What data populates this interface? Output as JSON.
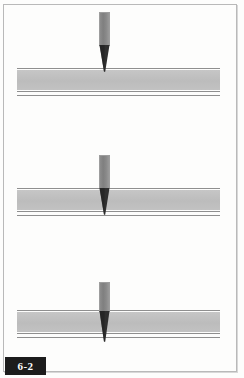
{
  "figure": {
    "number_label": "6-2",
    "caption": "",
    "page_background": "#fdfdfc",
    "frame_color": "#b9b9b9"
  },
  "colors": {
    "workpiece_fill": "#bfbfbf",
    "workpiece_edge": "#8f8f8f",
    "punch_shaft": "#858585",
    "punch_tip": "#2f2f2f",
    "tab_background": "#1c1c1c",
    "tab_text": "#ffffff"
  },
  "stages": [
    {
      "name": "stage-1-contact",
      "index": 1,
      "punch": {
        "shaft_top": 12,
        "shaft_height": 33,
        "tip_top": 45,
        "tip_height": 27,
        "center_x": 105,
        "penetration": "tip just touching top surface"
      },
      "workpiece": {
        "top_rule_y": 68,
        "body_top": 70,
        "body_height": 20,
        "bottom_rule_y": 91,
        "under_rule_y": 95
      }
    },
    {
      "name": "stage-2-piercing",
      "index": 2,
      "punch": {
        "shaft_top": 155,
        "shaft_height": 33,
        "tip_top": 188,
        "tip_height": 27,
        "center_x": 105,
        "penetration": "tip driven into the sheet"
      },
      "workpiece": {
        "top_rule_y": 188,
        "body_top": 190,
        "body_height": 20,
        "bottom_rule_y": 211,
        "under_rule_y": 215
      }
    },
    {
      "name": "stage-3-through",
      "index": 3,
      "punch": {
        "shaft_top": 282,
        "shaft_height": 29,
        "tip_top": 311,
        "tip_height": 31,
        "center_x": 105,
        "penetration": "tip pushed fully through the sheet"
      },
      "workpiece": {
        "top_rule_y": 310,
        "body_top": 312,
        "body_height": 20,
        "bottom_rule_y": 333,
        "under_rule_y": 337
      }
    }
  ]
}
